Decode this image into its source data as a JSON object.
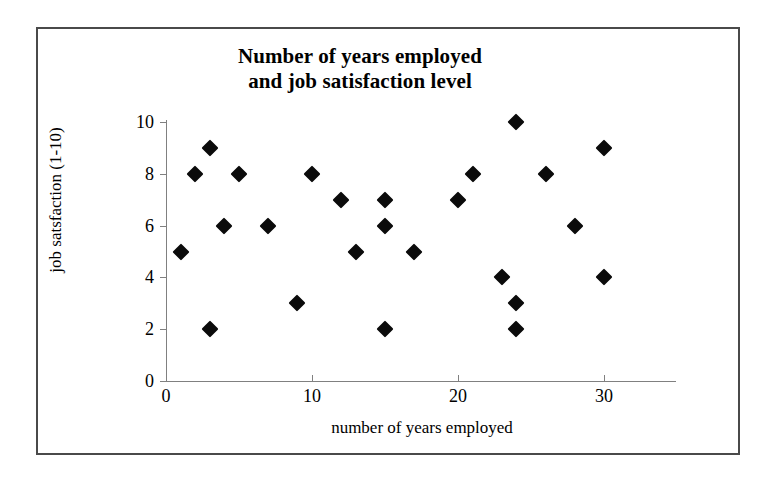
{
  "chart_data": {
    "type": "scatter",
    "title": "Number of years employed and job satisfaction level",
    "title_lines": [
      "Number of years employed",
      "and job satisfaction level"
    ],
    "xlabel": "number of years employed",
    "ylabel": "job satsfaction (1-10)",
    "xlim": [
      0,
      35
    ],
    "ylim": [
      0,
      10
    ],
    "xticks": [
      0,
      10,
      20,
      30
    ],
    "yticks": [
      0,
      2,
      4,
      6,
      8,
      10
    ],
    "xtick_labels": [
      "0",
      "10",
      "20",
      "30"
    ],
    "ytick_labels": [
      "0",
      "2",
      "4",
      "6",
      "8",
      "10"
    ],
    "grid": false,
    "legend": false,
    "marker": "diamond",
    "marker_color": "#0b0b0b",
    "axis_color": "#808080",
    "border_color": "#4a4a4a",
    "background_color": "#ffffff",
    "points": [
      {
        "x": 1,
        "y": 5
      },
      {
        "x": 2,
        "y": 8
      },
      {
        "x": 3,
        "y": 9
      },
      {
        "x": 3,
        "y": 2
      },
      {
        "x": 4,
        "y": 6
      },
      {
        "x": 5,
        "y": 8
      },
      {
        "x": 7,
        "y": 6
      },
      {
        "x": 9,
        "y": 3
      },
      {
        "x": 10,
        "y": 8
      },
      {
        "x": 12,
        "y": 7
      },
      {
        "x": 13,
        "y": 5
      },
      {
        "x": 15,
        "y": 7
      },
      {
        "x": 15,
        "y": 6
      },
      {
        "x": 15,
        "y": 2
      },
      {
        "x": 17,
        "y": 5
      },
      {
        "x": 20,
        "y": 7
      },
      {
        "x": 21,
        "y": 8
      },
      {
        "x": 23,
        "y": 4
      },
      {
        "x": 24,
        "y": 10
      },
      {
        "x": 24,
        "y": 3
      },
      {
        "x": 24,
        "y": 2
      },
      {
        "x": 26,
        "y": 8
      },
      {
        "x": 28,
        "y": 6
      },
      {
        "x": 30,
        "y": 9
      },
      {
        "x": 30,
        "y": 4
      }
    ]
  }
}
